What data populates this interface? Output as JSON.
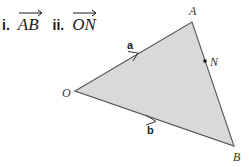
{
  "questions": [
    {
      "number": "i.",
      "vector": "AB"
    },
    {
      "number": "ii.",
      "vector": "ON"
    }
  ],
  "diagram": {
    "shape": "triangle",
    "fill_color": "#d9d9d9",
    "stroke_color": "#555555",
    "points": {
      "O": {
        "label": "O",
        "x": 75,
        "y": 91
      },
      "A": {
        "label": "A",
        "x": 192,
        "y": 22
      },
      "B": {
        "label": "B",
        "x": 234,
        "y": 146
      },
      "N": {
        "label": "N",
        "x": 205,
        "y": 61
      }
    },
    "vectors": {
      "a": {
        "label": "a",
        "from": "O",
        "to": "A"
      },
      "b": {
        "label": "b",
        "from": "O",
        "to": "B"
      }
    }
  }
}
